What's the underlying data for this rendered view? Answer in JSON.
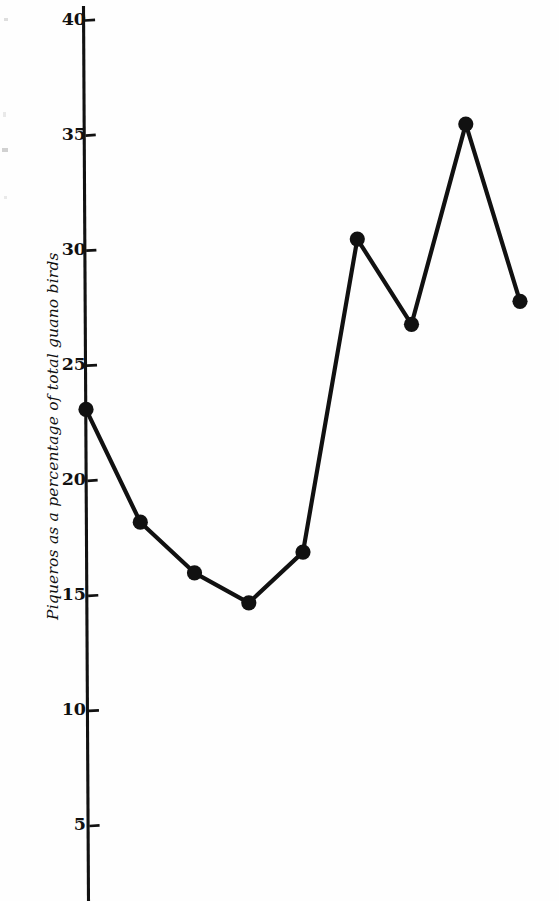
{
  "figure": {
    "kind": "scanned-line-chart",
    "background_color": "#fefefe",
    "ink_color": "#111111"
  },
  "axis": {
    "y_label": "Piqueros as a percentage of total guano birds",
    "tick_labels": [
      "40",
      "35",
      "30",
      "25",
      "20",
      "15",
      "10",
      "5"
    ]
  },
  "chart_data": {
    "type": "line",
    "title": "",
    "subtitle": "",
    "xlabel": "",
    "ylabel": "Piqueros as a percentage of total guano birds",
    "x": [
      1,
      2,
      3,
      4,
      5,
      6,
      7,
      8,
      9
    ],
    "values": [
      23.1,
      18.2,
      16.0,
      14.7,
      16.9,
      30.5,
      26.8,
      35.5,
      27.8
    ],
    "series": [
      {
        "name": "Piqueros as a percentage of total guano birds",
        "values": [
          23.1,
          18.2,
          16.0,
          14.7,
          16.9,
          30.5,
          26.8,
          35.5,
          27.8
        ]
      }
    ],
    "ylim": [
      0,
      41
    ],
    "y_ticks": [
      5,
      10,
      15,
      20,
      25,
      30,
      35,
      40
    ],
    "y_tick_labels": [
      "5",
      "10",
      "15",
      "20",
      "25",
      "30",
      "35",
      "40"
    ],
    "xlim": [
      0.5,
      9.6
    ],
    "x_ticks": [],
    "x_tick_labels": [],
    "grid": false,
    "legend": false,
    "legend_position": "none",
    "marker": "filled-circle",
    "marker_color": "#111111",
    "line_color": "#111111",
    "annotations": []
  }
}
